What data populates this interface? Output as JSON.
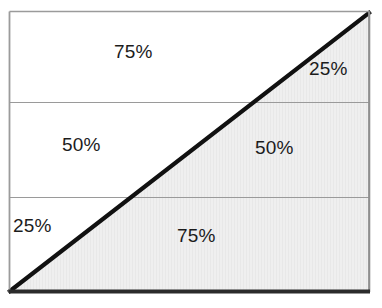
{
  "figure": {
    "name": "diagonal-split-percentage-diagram",
    "frame": {
      "x": 9,
      "y": 11,
      "width": 361,
      "height": 281,
      "border_color": "#8c8c8c",
      "bottom_border_color": "#2b2b2b",
      "background_color": "#ffffff"
    },
    "shaded_region": {
      "fill_color": "#eeeeee",
      "description": "region below-right of diagonal"
    },
    "diagonal": {
      "color": "#111111",
      "thickness": 4,
      "from": "bottom-left",
      "to": "top-right"
    },
    "dividers": {
      "color": "#9a9a9a",
      "thickness": 1,
      "y_positions": [
        102,
        197
      ]
    },
    "labels": [
      {
        "id": "top-left",
        "text": "75%",
        "band": "top",
        "side": "left"
      },
      {
        "id": "top-right",
        "text": "25%",
        "band": "top",
        "side": "right"
      },
      {
        "id": "mid-left",
        "text": "50%",
        "band": "middle",
        "side": "left"
      },
      {
        "id": "mid-right",
        "text": "50%",
        "band": "middle",
        "side": "right"
      },
      {
        "id": "bot-left",
        "text": "25%",
        "band": "bottom",
        "side": "left"
      },
      {
        "id": "bot-right",
        "text": "75%",
        "band": "bottom",
        "side": "right"
      }
    ]
  }
}
